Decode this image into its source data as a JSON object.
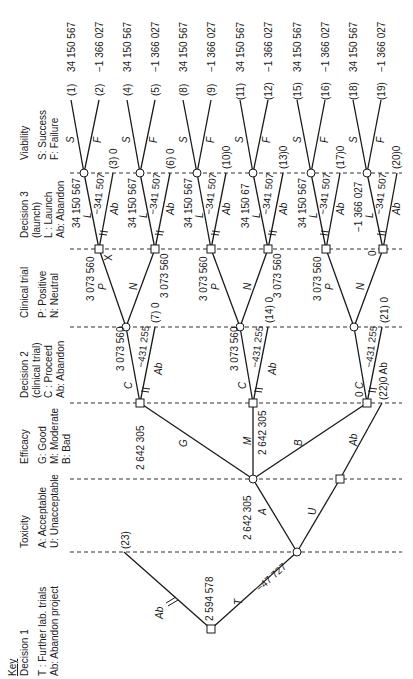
{
  "key": {
    "title": "Key",
    "columns": [
      {
        "id": "decision1",
        "heading": "Decision 1",
        "lines": [
          "T : Further lab. trials",
          "Ab: Abandon project"
        ]
      },
      {
        "id": "toxicity",
        "heading": "Toxicity",
        "lines": [
          "A: Acceptable",
          "U: Unacceptable"
        ]
      },
      {
        "id": "efficacy",
        "heading": "Efficacy",
        "lines": [
          "G: Good",
          "M: Moderate",
          "B: Bad"
        ]
      },
      {
        "id": "decision2",
        "heading": "Decision 2",
        "lines": [
          "(clinical trial)",
          "C : Proceed",
          "Ab: Abandon"
        ]
      },
      {
        "id": "clinical",
        "heading": "Clinical trial",
        "lines": [
          "P: Positive",
          "N: Neutral"
        ]
      },
      {
        "id": "decision3",
        "heading": "Decision 3",
        "lines": [
          "(launch)",
          "L : Launch",
          "Ab: Abandon"
        ]
      },
      {
        "id": "viability",
        "heading": "Viability",
        "lines": [
          "S: Success",
          "F: Failure"
        ]
      }
    ]
  },
  "tree": {
    "decision1": {
      "value": "2 594 578",
      "branch_T_label": "T",
      "branch_T_cost": "−47 727",
      "branch_Ab_label": "Ab",
      "terminal_23": "(23)"
    },
    "toxicity": {
      "branch_A": "A",
      "branch_U": "U",
      "value_A": "2 642 305"
    },
    "efficacy": {
      "branch_G": "G",
      "branch_M": "M",
      "branch_B": "B",
      "branch_U_Ab": "Ab",
      "value_G": "2 642 305",
      "value_M": "2 642 305",
      "value_B": "0"
    },
    "decision2": [
      {
        "C": "C",
        "cost": "−431 255",
        "value": "3 073 560",
        "Ab": "Ab",
        "terminal": "(7) 0"
      },
      {
        "C": "C",
        "cost": "−431 255",
        "value": "3 073 560",
        "Ab": "Ab",
        "terminal": "(14) 0"
      },
      {
        "C": "C",
        "cost": "−431 255",
        "value": "0",
        "Ab": "Ab",
        "terminal": "(21) 0",
        "ab_terminal": "(22)0 Ab"
      }
    ],
    "clinical": [
      {
        "P": "P",
        "N": "N",
        "value_P": "3 073 560",
        "value_N": "3 073 560",
        "marker": "X"
      },
      {
        "P": "P",
        "N": "N",
        "value_P": "3 073 560",
        "value_N": "3 073 560"
      },
      {
        "P": "P",
        "N": "N",
        "value_P": "3 073 560",
        "value_N": "0"
      }
    ],
    "decision3": [
      {
        "L": "L",
        "cost": "−341 507",
        "value": "34 150 567",
        "Ab": "Ab",
        "terminal": "(3) 0"
      },
      {
        "L": "L",
        "cost": "−341 507",
        "value": "34 150 567",
        "Ab": "Ab",
        "terminal": "(6) 0"
      },
      {
        "L": "L",
        "cost": "−341 507",
        "value": "34 150 567",
        "Ab": "Ab",
        "terminal": "(10)0"
      },
      {
        "L": "L",
        "cost": "−341 507",
        "value": "34 150 67",
        "Ab": "Ab",
        "terminal": "(13)0"
      },
      {
        "L": "L",
        "cost": "−341 507",
        "value": "34 150 567",
        "Ab": "Ab",
        "terminal": "(17)0"
      },
      {
        "L": "L",
        "cost": "−341 507",
        "value": "−1 366 027",
        "Ab": "Ab",
        "terminal": "(20)0"
      }
    ],
    "viability": [
      {
        "S": "S",
        "F": "F",
        "s_terminal": "(1)",
        "s_value": "34 150 567",
        "f_terminal": "(2)",
        "f_value": "−1 366 027"
      },
      {
        "S": "S",
        "F": "F",
        "s_terminal": "(4)",
        "s_value": "34 150 567",
        "f_terminal": "(5)",
        "f_value": "−1 366 027"
      },
      {
        "S": "S",
        "F": "F",
        "s_terminal": "(8)",
        "s_value": "34 150 567",
        "f_terminal": "(9)",
        "f_value": "−1 366 027"
      },
      {
        "S": "S",
        "F": "F",
        "s_terminal": "(11)",
        "s_value": "34 150 567",
        "f_terminal": "(12)",
        "f_value": "−1 366 027"
      },
      {
        "S": "S",
        "F": "F",
        "s_terminal": "(15)",
        "s_value": "34 150 567",
        "f_terminal": "(16)",
        "f_value": "−1 366 027"
      },
      {
        "S": "S",
        "F": "F",
        "s_terminal": "(18)",
        "s_value": "34 150 567",
        "f_terminal": "(19)",
        "f_value": "−1 366 027"
      }
    ]
  }
}
